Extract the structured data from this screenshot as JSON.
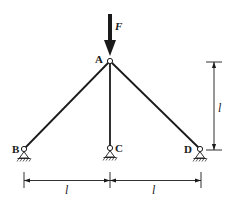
{
  "diagram": {
    "title": "",
    "type": "truss structure with three pinned supports",
    "nodes": {
      "A": {
        "label": "A",
        "x": 110,
        "y": 61
      },
      "B": {
        "label": "B",
        "x": 24,
        "y": 149
      },
      "C": {
        "label": "C",
        "x": 110,
        "y": 148
      },
      "D": {
        "label": "D",
        "x": 200,
        "y": 149
      }
    },
    "members": [
      "AB",
      "AC",
      "AD"
    ],
    "load": {
      "label": "F",
      "direction": "down",
      "applied_at": "A"
    },
    "dimensions": {
      "vertical": {
        "label": "l",
        "description": "height from A to supports"
      },
      "horizontal_left": {
        "label": "l",
        "description": "distance B to C"
      },
      "horizontal_right": {
        "label": "l",
        "description": "distance C to D"
      }
    },
    "colors": {
      "ink": "#1a1a1a",
      "background": "#ffffff"
    }
  }
}
